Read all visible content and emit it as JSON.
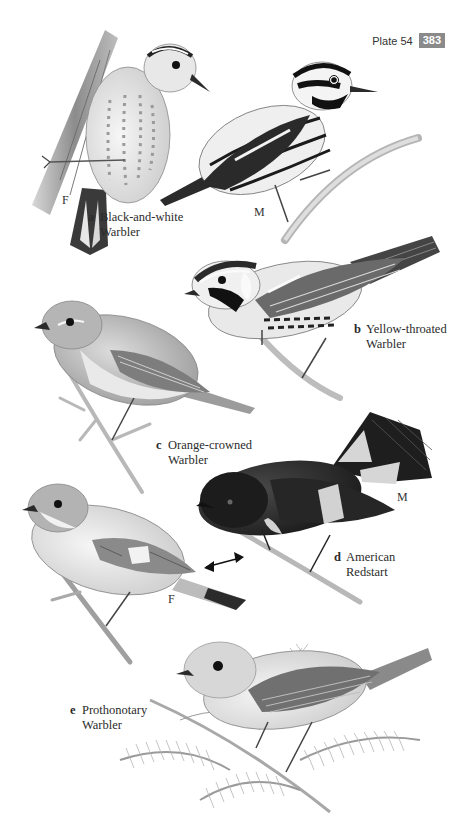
{
  "header": {
    "plate_label": "Plate 54",
    "page_number": "383"
  },
  "species": [
    {
      "letter": "a",
      "name_line1": "Black-and-white",
      "name_line2": "Warbler",
      "figures": [
        "F",
        "M"
      ]
    },
    {
      "letter": "b",
      "name_line1": "Yellow-throated",
      "name_line2": "Warbler",
      "figures": []
    },
    {
      "letter": "c",
      "name_line1": "Orange-crowned",
      "name_line2": "Warbler",
      "figures": []
    },
    {
      "letter": "d",
      "name_line1": "American",
      "name_line2": "Redstart",
      "figures": [
        "M",
        "F"
      ]
    },
    {
      "letter": "e",
      "name_line1": "Prothonotary",
      "name_line2": "Warbler",
      "figures": []
    }
  ],
  "sex_labels": {
    "a_female": "F",
    "a_male": "M",
    "d_male": "M",
    "d_female": "F"
  },
  "icons": {
    "double-arrow": "↔"
  },
  "colors": {
    "page_number_bg": "#8a8a8a",
    "ink": "#2a2a2a"
  }
}
